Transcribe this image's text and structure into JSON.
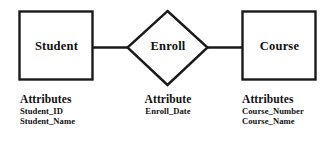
{
  "diagram": {
    "type": "entity-relationship-diagram",
    "background_color": "#ffffff",
    "stroke_color": "#1a1a1a",
    "entities": [
      {
        "id": "student",
        "shape": "rectangle",
        "label": "Student",
        "attributes_heading": "Attributes",
        "attributes": [
          "Student_ID",
          "Student_Name"
        ]
      },
      {
        "id": "course",
        "shape": "rectangle",
        "label": "Course",
        "attributes_heading": "Attributes",
        "attributes": [
          "Course_Number",
          "Course_Name"
        ]
      }
    ],
    "relationship": {
      "id": "enroll",
      "shape": "diamond",
      "label": "Enroll",
      "attributes_heading": "Attribute",
      "attributes": [
        "Enroll_Date"
      ]
    },
    "connectors": [
      {
        "id": "student-enroll",
        "from": "student",
        "to": "enroll"
      },
      {
        "id": "enroll-course",
        "from": "enroll",
        "to": "course"
      }
    ]
  }
}
